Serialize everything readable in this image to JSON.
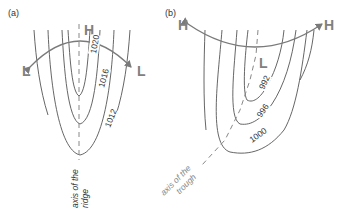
{
  "panels": [
    {
      "id": "a",
      "label": "(a)",
      "feature": "ridge",
      "high_label": "H",
      "low_labels": [
        "L",
        "L"
      ],
      "isobars": [
        "1020",
        "1016",
        "1012"
      ],
      "axis_label_line1": "axis of the",
      "axis_label_line2": "ridge"
    },
    {
      "id": "b",
      "label": "(b)",
      "feature": "trough",
      "low_label": "L",
      "high_labels": [
        "H",
        "H"
      ],
      "isobars": [
        "992",
        "996",
        "1000"
      ],
      "axis_label_line1": "axis of the",
      "axis_label_line2": "trough"
    }
  ],
  "colors": {
    "isobar": "#555555",
    "axis": "#888888",
    "arrow": "#7a7a7a",
    "pressure_letter": "#808080"
  }
}
